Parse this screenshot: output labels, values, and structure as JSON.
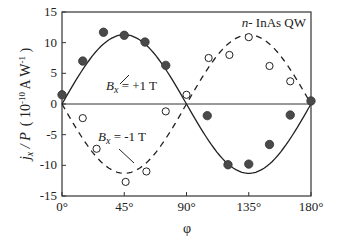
{
  "chart_data": {
    "type": "scatter",
    "title": "",
    "annotation_title": "n- InAs QW",
    "xlabel": "φ",
    "ylabel": "j_x / P  ( 10^-10 A W^-1 )",
    "ylabel_parts": {
      "main": "j",
      "sub": "x",
      "rest": " / P",
      "unit_open": "( 10",
      "unit_exp": "-10",
      "unit_mid": " A W",
      "unit_exp2": "-1",
      "unit_close": " )"
    },
    "xlim": [
      0,
      180
    ],
    "ylim": [
      -15,
      15
    ],
    "x_ticks": [
      0,
      45,
      90,
      135,
      180
    ],
    "x_tick_labels": [
      "0°",
      "45°",
      "90°",
      "135°",
      "180°"
    ],
    "y_ticks": [
      -15,
      -10,
      -5,
      0,
      5,
      10,
      15
    ],
    "y_tick_labels": [
      "-15",
      "-10",
      "-5",
      "0",
      "5",
      "10",
      "15"
    ],
    "grid": false,
    "zero_line": true,
    "series": [
      {
        "name": "B_x = +1 T",
        "label_main": "B",
        "label_sub": "x",
        "label_rest": " = +1 T",
        "marker": "filled-circle",
        "fit": {
          "form": "A*sin(2φ)",
          "amplitude": 11.3,
          "line": "solid"
        },
        "points": [
          [
            0,
            1.5
          ],
          [
            15,
            7.0
          ],
          [
            30,
            11.7
          ],
          [
            45,
            11.2
          ],
          [
            60,
            10.1
          ],
          [
            75,
            6.3
          ],
          [
            105,
            -1.9
          ],
          [
            120,
            -9.9
          ],
          [
            135,
            -9.8
          ],
          [
            150,
            -6.6
          ],
          [
            165,
            -1.8
          ],
          [
            180,
            0.5
          ]
        ]
      },
      {
        "name": "B_x = -1 T",
        "label_main": "B",
        "label_sub": "x",
        "label_rest": " = -1 T",
        "marker": "open-circle",
        "fit": {
          "form": "A*sin(2φ)",
          "amplitude": -11.3,
          "line": "dashed"
        },
        "points": [
          [
            15,
            -2.3
          ],
          [
            25,
            -7.3
          ],
          [
            46,
            -12.7
          ],
          [
            61,
            -11.0
          ],
          [
            75,
            -1.2
          ],
          [
            90,
            1.5
          ],
          [
            106,
            7.5
          ],
          [
            121,
            8.0
          ],
          [
            135,
            10.9
          ],
          [
            150,
            6.2
          ],
          [
            165,
            3.7
          ]
        ]
      }
    ]
  }
}
